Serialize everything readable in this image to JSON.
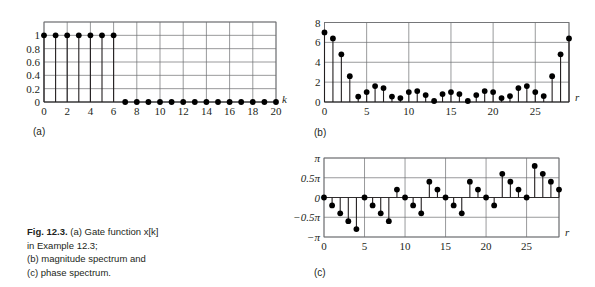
{
  "caption": {
    "fig": "Fig. 12.3.",
    "line1": " (a) Gate function x[k]",
    "line2": "in Example 12.3;",
    "line3": "(b) magnitude spectrum and",
    "line4": "(c) phase spectrum."
  },
  "panels": {
    "a": "(a)",
    "b": "(b)",
    "c": "(c)"
  },
  "chart_data": [
    {
      "id": "a",
      "type": "stem",
      "title": "Gate function x[k]",
      "xlabel": "k",
      "ylabel": "",
      "xlim": [
        0,
        20
      ],
      "ylim": [
        0,
        1.2
      ],
      "grid": true,
      "xticks": [
        0,
        2,
        4,
        6,
        8,
        10,
        12,
        14,
        16,
        18,
        20
      ],
      "yticks": [
        0,
        0.2,
        0.4,
        0.6,
        0.8,
        1
      ],
      "ytick_labels": [
        "0",
        "0.2",
        "0.4",
        "0.6",
        "0.8",
        "1"
      ],
      "x": [
        0,
        1,
        2,
        3,
        4,
        5,
        6,
        7,
        8,
        9,
        10,
        11,
        12,
        13,
        14,
        15,
        16,
        17,
        18,
        19,
        20
      ],
      "values": [
        1,
        1,
        1,
        1,
        1,
        1,
        1,
        0,
        0,
        0,
        0,
        0,
        0,
        0,
        0,
        0,
        0,
        0,
        0,
        0,
        0
      ]
    },
    {
      "id": "b",
      "type": "stem",
      "title": "Magnitude spectrum",
      "xlabel": "r",
      "ylabel": "",
      "xlim": [
        0,
        29
      ],
      "ylim": [
        0,
        8
      ],
      "grid": true,
      "xticks": [
        0,
        5,
        10,
        15,
        20,
        25
      ],
      "yticks": [
        0,
        2,
        4,
        6,
        8
      ],
      "ytick_labels": [
        "0",
        "2",
        "4",
        "6",
        "8"
      ],
      "x": [
        0,
        1,
        2,
        3,
        4,
        5,
        6,
        7,
        8,
        9,
        10,
        11,
        12,
        13,
        14,
        15,
        16,
        17,
        18,
        19,
        20,
        21,
        22,
        23,
        24,
        25,
        26,
        27,
        28,
        29
      ],
      "values": [
        7.0,
        6.4,
        4.8,
        2.6,
        0.55,
        1.0,
        1.6,
        1.4,
        0.55,
        0.4,
        1.0,
        1.1,
        0.7,
        0.1,
        0.8,
        1.0,
        0.8,
        0.1,
        0.7,
        1.1,
        1.0,
        0.4,
        0.6,
        1.4,
        1.6,
        1.0,
        0.6,
        2.6,
        4.8,
        6.4
      ]
    },
    {
      "id": "c",
      "type": "stem",
      "title": "Phase spectrum",
      "xlabel": "r",
      "ylabel": "",
      "units": "pi",
      "xlim": [
        0,
        29
      ],
      "ylim": [
        -1,
        1
      ],
      "grid": true,
      "xticks": [
        0,
        5,
        10,
        15,
        20,
        25
      ],
      "yticks": [
        -1,
        -0.5,
        0,
        0.5,
        1
      ],
      "ytick_labels": [
        "−π",
        "−0.5π",
        "0",
        "0.5π",
        "π"
      ],
      "x": [
        0,
        1,
        2,
        3,
        4,
        5,
        6,
        7,
        8,
        9,
        10,
        11,
        12,
        13,
        14,
        15,
        16,
        17,
        18,
        19,
        20,
        21,
        22,
        23,
        24,
        25,
        26,
        27,
        28,
        29
      ],
      "values": [
        0,
        -0.2,
        -0.4,
        -0.6,
        -0.8,
        0,
        -0.2,
        -0.4,
        -0.6,
        0.2,
        0,
        -0.2,
        -0.4,
        0.4,
        0.2,
        0,
        -0.2,
        -0.4,
        0.4,
        0.2,
        0,
        -0.2,
        0.6,
        0.4,
        0.2,
        0,
        0.8,
        0.6,
        0.4,
        0.2
      ]
    }
  ]
}
